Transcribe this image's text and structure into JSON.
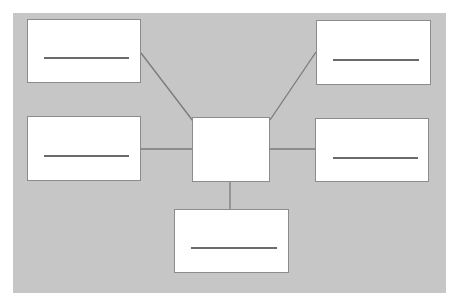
{
  "diagram": {
    "type": "hub-and-spoke",
    "colors": {
      "page_background": "#ffffff",
      "panel_background": "#c6c6c6",
      "node_fill": "#ffffff",
      "node_border": "#8c8c8c",
      "connector": "#7a7a7a",
      "placeholder_line": "#6a6a6a"
    },
    "panel": {
      "x": 13,
      "y": 13,
      "w": 433,
      "h": 280
    },
    "center": {
      "id": "center",
      "x": 192,
      "y": 117,
      "w": 78,
      "h": 65,
      "has_placeholder_line": false,
      "label": ""
    },
    "nodes": [
      {
        "id": "top-left",
        "x": 27,
        "y": 19,
        "w": 114,
        "h": 64,
        "line": {
          "x1": 16,
          "x2": 101,
          "y": 37
        },
        "label": ""
      },
      {
        "id": "middle-left",
        "x": 27,
        "y": 116,
        "w": 114,
        "h": 65,
        "line": {
          "x1": 16,
          "x2": 101,
          "y": 38
        },
        "label": ""
      },
      {
        "id": "top-right",
        "x": 316,
        "y": 20,
        "w": 115,
        "h": 65,
        "line": {
          "x1": 16,
          "x2": 102,
          "y": 38
        },
        "label": ""
      },
      {
        "id": "middle-right",
        "x": 315,
        "y": 118,
        "w": 114,
        "h": 64,
        "line": {
          "x1": 17,
          "x2": 102,
          "y": 38
        },
        "label": ""
      },
      {
        "id": "bottom",
        "x": 174,
        "y": 209,
        "w": 115,
        "h": 64,
        "line": {
          "x1": 16,
          "x2": 102,
          "y": 37
        },
        "label": ""
      }
    ],
    "edges": [
      {
        "from": "top-left",
        "to": "center",
        "x1": 141,
        "y1": 53,
        "x2": 193,
        "y2": 121
      },
      {
        "from": "top-right",
        "to": "center",
        "x1": 316,
        "y1": 52,
        "x2": 270,
        "y2": 120
      },
      {
        "from": "middle-left",
        "to": "center",
        "x1": 141,
        "y1": 149,
        "x2": 192,
        "y2": 149
      },
      {
        "from": "middle-right",
        "to": "center",
        "x1": 270,
        "y1": 149,
        "x2": 315,
        "y2": 149
      },
      {
        "from": "center",
        "to": "bottom",
        "x1": 230,
        "y1": 182,
        "x2": 230,
        "y2": 209
      }
    ]
  }
}
